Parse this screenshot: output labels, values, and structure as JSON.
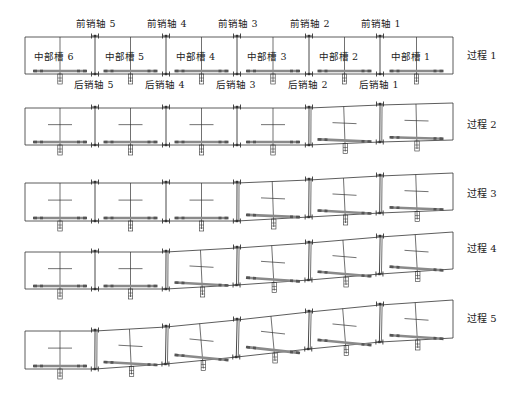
{
  "diagram": {
    "type": "mechanism-deformation-sequence",
    "processes": [
      {
        "label": "过程 1",
        "left_x": 25,
        "right_x": 453,
        "joints_x": [
          95,
          166,
          237,
          309,
          380
        ],
        "top_y": [
          37,
          37,
          37,
          37,
          37,
          37,
          37
        ],
        "bottom_y": [
          74,
          74,
          74,
          74,
          74,
          74,
          74
        ],
        "label_pos": [
          467,
          59
        ],
        "segments_labels": [
          "中部槽 6",
          "中部槽 5",
          "中部槽 4",
          "中部槽 3",
          "中部槽 2",
          "中部槽 1"
        ],
        "front_pins": [
          "前销轴 5",
          "前销轴 4",
          "前销轴 3",
          "前销轴 2",
          "前销轴 1"
        ],
        "rear_pins": [
          "后销轴 5",
          "后销轴 4",
          "后销轴 3",
          "后销轴 2",
          "后销轴 1"
        ]
      },
      {
        "label": "过程 2",
        "left_x": 25,
        "right_x": 453,
        "joints_x": [
          95,
          166,
          237,
          309,
          380
        ],
        "top_y": [
          108,
          108,
          108,
          108,
          108,
          105,
          103
        ],
        "bottom_y": [
          145,
          145,
          145,
          145,
          145,
          142,
          140
        ],
        "label_pos": [
          467,
          128
        ]
      },
      {
        "label": "过程 3",
        "left_x": 25,
        "right_x": 453,
        "joints_x": [
          95,
          166,
          237,
          309,
          380
        ],
        "top_y": [
          183,
          183,
          183,
          183,
          180,
          176,
          173
        ],
        "bottom_y": [
          221,
          221,
          221,
          221,
          217,
          213,
          210
        ],
        "label_pos": [
          467,
          197
        ]
      },
      {
        "label": "过程 4",
        "left_x": 25,
        "right_x": 453,
        "joints_x": [
          95,
          166,
          237,
          309,
          380
        ],
        "top_y": [
          252,
          252,
          252,
          248,
          243,
          237,
          232
        ],
        "bottom_y": [
          289,
          289,
          289,
          285,
          280,
          274,
          269
        ],
        "label_pos": [
          467,
          252
        ]
      },
      {
        "label": "过程 5",
        "left_x": 25,
        "right_x": 453,
        "joints_x": [
          95,
          166,
          237,
          309,
          380
        ],
        "top_y": [
          331,
          331,
          327,
          320,
          312,
          305,
          300
        ],
        "bottom_y": [
          369,
          369,
          364,
          357,
          349,
          342,
          338
        ],
        "label_pos": [
          467,
          322
        ]
      }
    ],
    "colors": {
      "line": "#333333",
      "bar": "#8a8a8a",
      "bar_end": "#555555",
      "text": "#222222"
    }
  }
}
